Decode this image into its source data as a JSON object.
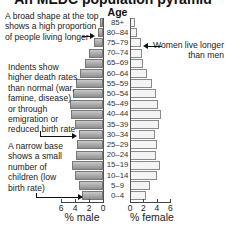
{
  "chart_data": {
    "type": "bar",
    "subtype": "population-pyramid",
    "title": "An MEDC population pyramid",
    "age_axis_label": "Age",
    "categories": [
      "85+",
      "80–84",
      "75–79",
      "70–74",
      "65–69",
      "60–64",
      "55–59",
      "50–54",
      "45–49",
      "40–44",
      "35–39",
      "30–34",
      "25–29",
      "20–24",
      "15–19",
      "10–14",
      "5–9",
      "0–4"
    ],
    "series": [
      {
        "name": "% male",
        "side": "left",
        "color": "#a8a8a8",
        "values": [
          0.4,
          0.7,
          1.3,
          2.0,
          2.6,
          3.3,
          3.9,
          4.3,
          4.7,
          4.6,
          4.0,
          3.4,
          3.7,
          3.9,
          4.4,
          4.0,
          3.4,
          3.0
        ]
      },
      {
        "name": "% female",
        "side": "right",
        "color": "#f4f4f4",
        "values": [
          0.8,
          1.0,
          1.6,
          1.8,
          2.0,
          2.5,
          3.3,
          3.9,
          4.2,
          4.6,
          4.3,
          3.7,
          4.0,
          3.9,
          4.5,
          4.0,
          3.0,
          2.4
        ]
      }
    ],
    "xlabel_left": "% male",
    "xlabel_right": "% female",
    "xticks_left": [
      "6",
      "4",
      "2",
      "0"
    ],
    "xticks_right": [
      "0",
      "2",
      "4",
      "6"
    ],
    "xlim": [
      0,
      6
    ],
    "grid": false,
    "legend": "none",
    "annotations": [
      {
        "text": "A broad shape at the top shows a high proportion of people living longer",
        "points_to": "80–84 (male)"
      },
      {
        "text": "Women live longer than men",
        "points_to": "75–79 (female)"
      },
      {
        "text": "Indents show higher death rates than normal (war, famine, disease) or through emigration or reduced birth rate",
        "points_to": "30–34 (male)"
      },
      {
        "text": "A narrow base shows a small number of children (low birth rate)",
        "points_to": "0–4 (male)"
      }
    ]
  },
  "labels": {
    "title": "An MEDC population pyramid",
    "age": "Age",
    "male_axis": "% male",
    "female_axis": "% female"
  },
  "notes": {
    "top_lines": [
      "A broad shape at the top",
      "shows a high proportion",
      "of people living longer"
    ],
    "women_lines": [
      "Women live longer",
      "than men"
    ],
    "indent_lines": [
      "Indents show",
      "higher death rates",
      "than normal (war,",
      "famine, disease)",
      "or through",
      "emigration or",
      "reduced birth rate"
    ],
    "base_lines": [
      "A narrow base",
      "shows a small",
      "number of",
      "children (low",
      "birth rate)"
    ]
  }
}
